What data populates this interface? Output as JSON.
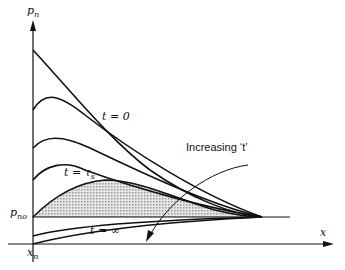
{
  "diagram": {
    "axes": {
      "y_label": "p",
      "y_label_sub": "n",
      "x_label": "x",
      "origin_label": "x",
      "origin_label_sub": "n",
      "baseline_label": "p",
      "baseline_label_sub": "no"
    },
    "curve_labels": {
      "t0": "t = 0",
      "ts": "t = τ",
      "ts_sub": "s",
      "tinf": "t = ∞"
    },
    "annotation": "Increasing ‘t’",
    "colors": {
      "line": "#111111",
      "shade": "#c8c8c8",
      "background": "#ffffff"
    }
  }
}
